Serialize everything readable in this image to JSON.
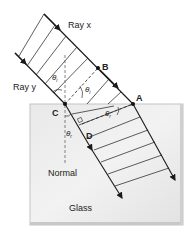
{
  "labels": {
    "ray_x": "Ray x",
    "ray_y": "Ray y",
    "point_a": "A",
    "point_b": "B",
    "point_c": "C",
    "point_d": "D",
    "theta_i": "θ",
    "theta_i_sub": "i",
    "theta_r": "θ",
    "theta_r_sub": "r",
    "normal": "Normal",
    "glass": "Glass"
  },
  "colors": {
    "ray": "#1a1a1a",
    "wavefront": "#333333",
    "glass_fill": "#e4e4e4",
    "glass_edge": "#bdbdbd",
    "dashed": "#444444"
  }
}
